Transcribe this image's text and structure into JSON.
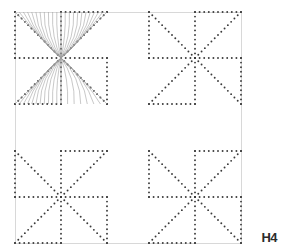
{
  "figure": {
    "label": "H4",
    "frame": {
      "x": 15,
      "y": 12,
      "width": 226,
      "height": 231,
      "color": "#d8d8d8",
      "stroke_width": 1
    },
    "background_color": "#ffffff",
    "dot_color": "#3a3a3a",
    "dot_radius": 0.95,
    "dot_spacing": 4.6,
    "curve_color": "#9a9a9a",
    "curve_width": 0.55,
    "quadrants": [
      {
        "name": "top-left",
        "origin_x": 15,
        "origin_y": 12,
        "size": 92,
        "has_curves": true
      },
      {
        "name": "top-right",
        "origin_x": 149,
        "origin_y": 12,
        "size": 92,
        "has_curves": false
      },
      {
        "name": "bottom-left",
        "origin_x": 15,
        "origin_y": 151,
        "size": 92,
        "has_curves": false
      },
      {
        "name": "bottom-right",
        "origin_x": 149,
        "origin_y": 151,
        "size": 92,
        "has_curves": false
      }
    ],
    "block_pinwheel": [
      {
        "cell_col": 0,
        "cell_row": 0,
        "rotation": 0
      },
      {
        "cell_col": 1,
        "cell_row": 0,
        "rotation": 90
      },
      {
        "cell_col": 0,
        "cell_row": 1,
        "rotation": 270
      },
      {
        "cell_col": 1,
        "cell_row": 1,
        "rotation": 180
      }
    ],
    "curve_bundles": [
      {
        "name": "upper-left-fan",
        "cell_col": 0,
        "cell_row": 0,
        "ray_count": 11,
        "focus_u": 1.0,
        "focus_v": 1.0
      },
      {
        "name": "upper-right-fan",
        "cell_col": 1,
        "cell_row": 0,
        "ray_count": 11,
        "focus_u": 0.0,
        "focus_v": 1.0
      },
      {
        "name": "lower-left-fan",
        "cell_col": 0,
        "cell_row": 1,
        "ray_count": 11,
        "focus_u": 1.0,
        "focus_v": 0.0
      },
      {
        "name": "lower-right-fan",
        "cell_col": 1,
        "cell_row": 1,
        "ray_count": 7,
        "focus_u": 0.0,
        "focus_v": 0.0
      }
    ]
  }
}
